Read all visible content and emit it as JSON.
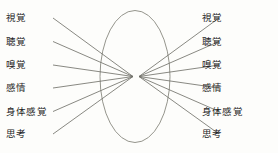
{
  "diagram": {
    "type": "funnel-convergence",
    "background_color": "#fdfdfb",
    "line_color": "#6b6b63",
    "ellipse_color": "#7a7a70",
    "text_color": "#242424",
    "center_shape": {
      "name": "central-ellipse",
      "cx": 135,
      "cy": 76.5,
      "rx": 35,
      "ry": 66
    },
    "row_positions_y": [
      18,
      41.5,
      65,
      88,
      111.5,
      134
    ],
    "left": {
      "name": "left-modality-column",
      "items": [
        {
          "label": "視覚"
        },
        {
          "label": "聴覚"
        },
        {
          "label": "嗅覚"
        },
        {
          "label": "感情"
        },
        {
          "label": "身体感覚"
        },
        {
          "label": "思考"
        }
      ]
    },
    "right": {
      "name": "right-modality-column",
      "items": [
        {
          "label": "視覚"
        },
        {
          "label": "聴覚"
        },
        {
          "label": "嗅覚"
        },
        {
          "label": "感情"
        },
        {
          "label": "身体感覚"
        },
        {
          "label": "思考"
        }
      ]
    },
    "connectors": {
      "name": "convergence-lines",
      "left_focus": {
        "x": 133,
        "y": 76.5
      },
      "right_focus": {
        "x": 139,
        "y": 76.5
      },
      "left_start_x": 53,
      "right_start_x": 219,
      "count_per_side": 6
    }
  }
}
